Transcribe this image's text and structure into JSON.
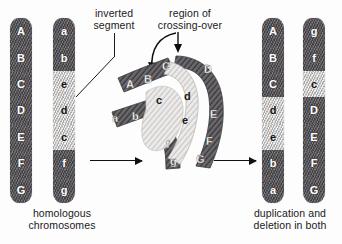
{
  "figure": {
    "background": "#fdfdfd",
    "dark_band_color": "#58565a",
    "light_band_color": "#dedcda",
    "ink_color": "#1a1a1a"
  },
  "annotations": {
    "inverted_segment": "inverted\nsegment",
    "region_of_crossing_over": "region of\ncrossing-over",
    "homologous_chromosomes": "homologous\nchromosomes",
    "duplication_and_deletion": "duplication and\ndeletion in both"
  },
  "left_pair": {
    "caption": "homologous\nchromosomes",
    "chromosome_1": {
      "name": "normal-chromosome",
      "bands": [
        {
          "label": "A",
          "shade": "dark"
        },
        {
          "label": "B",
          "shade": "dark"
        },
        {
          "label": "C",
          "shade": "dark"
        },
        {
          "label": "D",
          "shade": "dark"
        },
        {
          "label": "E",
          "shade": "dark"
        },
        {
          "label": "F",
          "shade": "dark"
        },
        {
          "label": "G",
          "shade": "dark"
        }
      ]
    },
    "chromosome_2": {
      "name": "inverted-chromosome",
      "bands": [
        {
          "label": "a",
          "shade": "dark"
        },
        {
          "label": "b",
          "shade": "dark"
        },
        {
          "label": "e",
          "shade": "light"
        },
        {
          "label": "d",
          "shade": "light"
        },
        {
          "label": "c",
          "shade": "light"
        },
        {
          "label": "f",
          "shade": "dark"
        },
        {
          "label": "g",
          "shade": "dark"
        }
      ]
    }
  },
  "center_pairing": {
    "name": "inversion-loop-with-crossover",
    "upper_left_arm": [
      "A",
      "B",
      "C"
    ],
    "lower_left_arm": [
      "a",
      "b",
      "c"
    ],
    "loop_inner": [
      "d",
      "e"
    ],
    "loop_outer": [
      "C",
      "D"
    ],
    "right_arm": [
      "D",
      "E",
      "F",
      "G"
    ],
    "lower_right_arm": [
      "f",
      "g"
    ]
  },
  "right_pair": {
    "caption": "duplication and\ndeletion in both",
    "chromosome_3": {
      "name": "recombinant-chromosome-1",
      "bands": [
        {
          "label": "A",
          "shade": "dark"
        },
        {
          "label": "B",
          "shade": "dark"
        },
        {
          "label": "C",
          "shade": "dark"
        },
        {
          "label": "d",
          "shade": "light"
        },
        {
          "label": "e",
          "shade": "light"
        },
        {
          "label": "b",
          "shade": "dark"
        },
        {
          "label": "a",
          "shade": "dark"
        }
      ]
    },
    "chromosome_4": {
      "name": "recombinant-chromosome-2",
      "bands": [
        {
          "label": "g",
          "shade": "dark"
        },
        {
          "label": "f",
          "shade": "dark"
        },
        {
          "label": "c",
          "shade": "light"
        },
        {
          "label": "D",
          "shade": "dark"
        },
        {
          "label": "E",
          "shade": "dark"
        },
        {
          "label": "F",
          "shade": "dark"
        },
        {
          "label": "G",
          "shade": "dark"
        }
      ]
    }
  }
}
